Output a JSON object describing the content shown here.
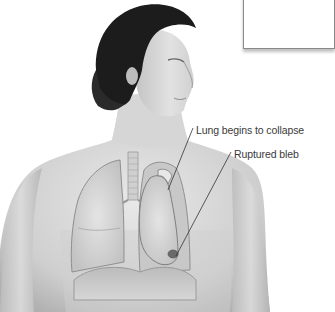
{
  "figure": {
    "labels": [
      {
        "id": "lung-collapse",
        "text": "Lung begins to collapse"
      },
      {
        "id": "ruptured-bleb",
        "text": "Ruptured bleb"
      }
    ]
  },
  "colors": {
    "background": "#ffffff",
    "skin_light": "#e6e6e6",
    "skin_mid": "#c9c9c9",
    "skin_dark": "#a8a8a8",
    "hair": "#1a1a1a",
    "lung_fill": "#d8d8d8",
    "lung_edge": "#8f8f8f",
    "label_text": "#3a3a3a",
    "leader_line": "#333333"
  }
}
